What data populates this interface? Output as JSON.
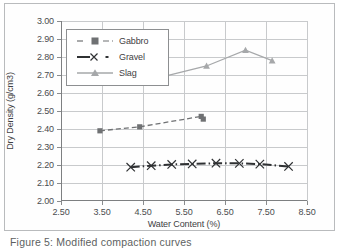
{
  "chart_data": {
    "type": "line",
    "title": "",
    "xlabel": "Water Content (%)",
    "ylabel": "Dry Density (g/cm3)",
    "xlim": [
      2.5,
      8.5
    ],
    "ylim": [
      2.0,
      3.0
    ],
    "xticks": [
      "2.50",
      "3.50",
      "4.50",
      "5.50",
      "6.50",
      "7.50",
      "8.50"
    ],
    "xtick_values": [
      2.5,
      3.5,
      4.5,
      5.5,
      6.5,
      7.5,
      8.5
    ],
    "yticks": [
      "2.00",
      "2.10",
      "2.20",
      "2.30",
      "2.40",
      "2.50",
      "2.60",
      "2.70",
      "2.80",
      "2.90",
      "3.00"
    ],
    "ytick_values": [
      2.0,
      2.1,
      2.2,
      2.3,
      2.4,
      2.5,
      2.6,
      2.7,
      2.8,
      2.9,
      3.0
    ],
    "grid": true,
    "legend_position": "upper-left-inside",
    "series": [
      {
        "name": "Gabbro",
        "marker": "square",
        "linestyle": "dashed",
        "color": "#6f7173",
        "x": [
          3.45,
          4.42,
          5.92,
          5.97
        ],
        "y": [
          2.39,
          2.412,
          2.47,
          2.455
        ]
      },
      {
        "name": "Gravel",
        "marker": "x",
        "linestyle": "dash-dot",
        "color": "#2f3133",
        "x": [
          4.2,
          4.7,
          5.2,
          5.7,
          6.28,
          6.85,
          7.35,
          8.05
        ],
        "y": [
          2.188,
          2.196,
          2.203,
          2.206,
          2.21,
          2.209,
          2.205,
          2.192
        ]
      },
      {
        "name": "Slag",
        "marker": "triangle",
        "linestyle": "solid",
        "color": "#a6a8aa",
        "x": [
          4.35,
          6.05,
          7.0,
          7.65
        ],
        "y": [
          2.655,
          2.75,
          2.838,
          2.78
        ]
      }
    ]
  },
  "legend": {
    "items": [
      {
        "label": "Gabbro"
      },
      {
        "label": "Gravel"
      },
      {
        "label": "Slag"
      }
    ]
  },
  "caption": {
    "text": "Figure 5: Modified compaction curves"
  },
  "colors": {
    "grid": "#c8cacc",
    "axis": "#7d7f81",
    "gabbro": "#6f7173",
    "gravel": "#2f3133",
    "slag": "#a6a8aa",
    "text": "#3f4143",
    "frame": "#b9bbbd"
  }
}
